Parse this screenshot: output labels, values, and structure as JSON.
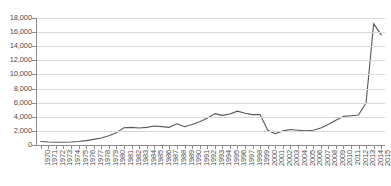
{
  "chart_data": {
    "type": "line",
    "title": "",
    "subtitle": "",
    "xlabel": "",
    "ylabel": "",
    "grid": true,
    "legend": false,
    "legend_position": "none",
    "line_color": "#595959",
    "gridline_color": "#d9d9d9",
    "axis_color": "#8c8c8c",
    "ylim": [
      0,
      18000
    ],
    "ytick_step": 2000,
    "ytick_labels": [
      "0",
      "2,000",
      "4,000",
      "6,000",
      "8,000",
      "10,000",
      "12,000",
      "14,000",
      "16,000",
      "18,000"
    ],
    "ytick_values": [
      0,
      2000,
      4000,
      6000,
      8000,
      10000,
      12000,
      14000,
      16000,
      18000
    ],
    "categories": [
      "1970",
      "1971",
      "1972",
      "1973",
      "1974",
      "1975",
      "1976",
      "1977",
      "1978",
      "1979",
      "1980",
      "1981",
      "1982",
      "1983",
      "1984",
      "1985",
      "1986",
      "1987",
      "1988",
      "1989",
      "1990",
      "1991",
      "1992",
      "1993",
      "1994",
      "1995",
      "1996",
      "1997",
      "1998",
      "1999",
      "2000",
      "2001",
      "2002",
      "2003",
      "2004",
      "2005",
      "2006",
      "2007",
      "2008",
      "2009",
      "2010",
      "2011",
      "2012",
      "2013",
      "2014",
      "2015"
    ],
    "values": [
      500,
      420,
      380,
      380,
      420,
      500,
      620,
      800,
      1000,
      1300,
      1750,
      2450,
      2500,
      2400,
      2500,
      2700,
      2600,
      2500,
      3000,
      2600,
      2900,
      3300,
      3800,
      4450,
      4200,
      4400,
      4800,
      4500,
      4300,
      4300,
      2100,
      1600,
      2000,
      2200,
      2100,
      2000,
      2100,
      2400,
      2900,
      3500,
      4050,
      4150,
      4250,
      6000,
      17200,
      15600
    ]
  }
}
